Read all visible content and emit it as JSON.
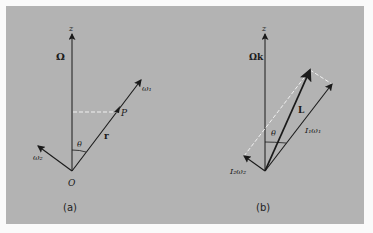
{
  "figure": {
    "background_color": "#b3b3b3",
    "line_color": "#1a1a1a",
    "dashed_color": "#f0f0f0"
  },
  "panel_a": {
    "caption": "(a)",
    "labels": {
      "z_axis": "z",
      "omega_big": "Ω",
      "omega1": "ω₁",
      "omega2": "ω₂",
      "point": "P",
      "radius": "r",
      "angle": "θ",
      "origin": "O"
    }
  },
  "panel_b": {
    "caption": "(b)",
    "labels": {
      "z_axis": "z",
      "omega_k": "Ωk",
      "angular_momentum": "L",
      "i1_omega1": "I₁ω₁",
      "i2_omega2": "I₂ω₂",
      "angle": "θ"
    }
  }
}
